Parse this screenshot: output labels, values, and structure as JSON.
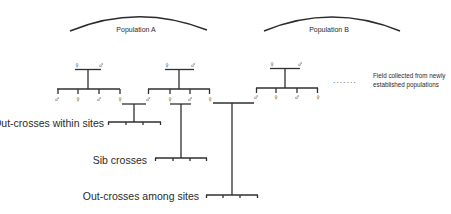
{
  "diagram": {
    "populations": [
      {
        "label": "Population A"
      },
      {
        "label": "Population B"
      }
    ],
    "symbols": {
      "female": "♀",
      "male": "♂"
    },
    "families": [
      {
        "parents": [
          "♀",
          "♂"
        ],
        "offspring": [
          "♂",
          "♀",
          "♂",
          "♀"
        ]
      },
      {
        "parents": [
          "♀",
          "♂"
        ],
        "offspring": [
          "♂",
          "♀",
          "♂",
          "♀"
        ]
      },
      {
        "parents": [
          "♀",
          "♂"
        ],
        "offspring": [
          "♂",
          "♀",
          "♂",
          "♀"
        ]
      }
    ],
    "ellipsis": ".......",
    "note": {
      "line1": "Field collected from newly",
      "line2": "established populations"
    },
    "crosses": [
      {
        "label": "Out-crosses within sites"
      },
      {
        "label": "Sib crosses"
      },
      {
        "label": "Out-crosses among sites"
      }
    ],
    "colors": {
      "line": "#2f2f2f",
      "text": "#2a2a2a",
      "background": "#ffffff"
    }
  }
}
